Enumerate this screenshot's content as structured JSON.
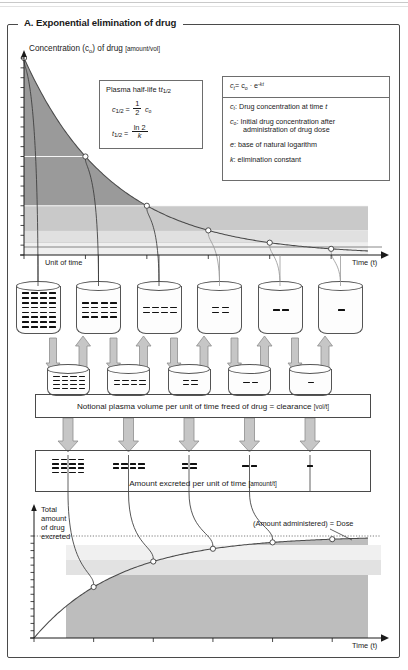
{
  "panel": {
    "title": "A. Exponential elimination of drug"
  },
  "top_chart": {
    "y_axis_label_main": "Concentration (c",
    "y_axis_label_sub": "o",
    "y_axis_label_tail": ") of drug ",
    "y_axis_units": "[amount/vol]",
    "x_axis_label": "Time (t)",
    "unit_of_time_label": "Unit of time"
  },
  "halflife_box": {
    "heading_text": "Plasma half-life t",
    "heading_sub": "1/2",
    "line1_lhs": "c",
    "line1_lhs_sub": "1/2",
    "line1_eq": "=",
    "line1_num": "1",
    "line1_den": "2",
    "line1_rhs": "c",
    "line1_rhs_sub": "o",
    "line2_lhs": "t",
    "line2_lhs_sub": "1/2",
    "line2_eq": "=",
    "line2_num": "ln 2",
    "line2_den": "k"
  },
  "formula_box": {
    "equation_lhs": "c",
    "equation_lhs_sub": "t",
    "equation_eq": "= c",
    "equation_c0_sub": "o",
    "equation_mid": " · e",
    "equation_exp": "-kt",
    "defs": [
      {
        "sym": "c",
        "sym_sub": "t",
        "text": ": Drug concentration at time ",
        "tail_italic": "t"
      },
      {
        "sym": "c",
        "sym_sub": "o",
        "text": ": Initial drug concentration after",
        "line2": "administration of drug dose"
      },
      {
        "sym": "e",
        "sym_sub": "",
        "text": ": base of natural logarithm"
      },
      {
        "sym": "k",
        "sym_sub": "",
        "text": ": elimination constant"
      }
    ]
  },
  "clearance_banner": {
    "text_main": "Notional plasma volume per unit of time freed of drug = clearance ",
    "text_units": "[vol/t]"
  },
  "excreted_banner": {
    "text_main": "Amount excreted per unit of time ",
    "text_units": "[amount/t]"
  },
  "bottom_chart": {
    "y_axis_label_lines": [
      "Total",
      "amount",
      "of drug",
      "excreted"
    ],
    "x_axis_label": "Time (t)",
    "asymptote_label": "(Amount administered) = Dose"
  },
  "beakers_row1": {
    "counts": [
      32,
      16,
      8,
      4,
      2,
      1
    ],
    "grid": [
      {
        "cols": 4,
        "rows": 8
      },
      {
        "cols": 4,
        "rows": 4
      },
      {
        "cols": 4,
        "rows": 2
      },
      {
        "cols": 2,
        "rows": 2
      },
      {
        "cols": 2,
        "rows": 1
      },
      {
        "cols": 1,
        "rows": 1
      }
    ]
  },
  "beakers_row2": {
    "counts": [
      16,
      8,
      4,
      2,
      1
    ],
    "grid": [
      {
        "cols": 4,
        "rows": 4
      },
      {
        "cols": 4,
        "rows": 2
      },
      {
        "cols": 2,
        "rows": 2
      },
      {
        "cols": 2,
        "rows": 1
      },
      {
        "cols": 1,
        "rows": 1
      }
    ]
  },
  "excreted_groups": {
    "counts": [
      16,
      8,
      4,
      2,
      1
    ],
    "grid": [
      {
        "cols": 4,
        "rows": 4
      },
      {
        "cols": 4,
        "rows": 2
      },
      {
        "cols": 2,
        "rows": 2
      },
      {
        "cols": 2,
        "rows": 1
      },
      {
        "cols": 1,
        "rows": 1
      }
    ]
  },
  "colors": {
    "ink": "#1a1a1a",
    "frame": "#4a4a4a",
    "curve": "#4d4d4d",
    "fill_dark": "#9a9a9a",
    "fill_mid": "#c4c4c4",
    "fill_light": "#dedede",
    "arrow_fill": "#c6c6c6",
    "arrow_stroke": "#8e8e8e"
  },
  "chart_data": {
    "type": "line",
    "title": "A. Exponential elimination of drug",
    "charts": [
      {
        "name": "plasma-concentration-decay",
        "type": "line",
        "title": "Exponential elimination of drug",
        "xlabel": "Time (t)",
        "ylabel": "Concentration (c_o) of drug [amount/vol]",
        "equation": "c_t = c_o · e^(-kt)",
        "x": [
          0,
          1,
          2,
          3,
          4,
          5
        ],
        "y": [
          1.0,
          0.5,
          0.25,
          0.125,
          0.0625,
          0.03125
        ],
        "x_tick_unit": "half-life (unit of time)",
        "marker_points": [
          {
            "t": 0,
            "c": 1.0
          },
          {
            "t": 1,
            "c": 0.5
          },
          {
            "t": 2,
            "c": 0.25
          },
          {
            "t": 3,
            "c": 0.125
          },
          {
            "t": 4,
            "c": 0.0625
          },
          {
            "t": 5,
            "c": 0.03125
          }
        ],
        "xlim": [
          0,
          5.6
        ],
        "ylim": [
          0,
          1.05
        ],
        "grid": false,
        "legend": "none",
        "shaded_bands": [
          {
            "from": 0.5,
            "to": 1.0,
            "shade": "dark"
          },
          {
            "from": 0.25,
            "to": 0.5,
            "shade": "mid"
          },
          {
            "from": 0.125,
            "to": 0.25,
            "shade": "light"
          }
        ]
      },
      {
        "name": "cumulative-excretion",
        "type": "area",
        "title": "Total amount of drug excreted",
        "xlabel": "Time (t)",
        "ylabel": "Total amount of drug excreted",
        "x": [
          0,
          1,
          2,
          3,
          4,
          5
        ],
        "y": [
          0,
          0.5,
          0.75,
          0.875,
          0.9375,
          0.96875
        ],
        "asymptote": {
          "value": 1.0,
          "label": "(Amount administered) = Dose"
        },
        "marker_points": [
          {
            "t": 1,
            "cum": 0.5
          },
          {
            "t": 2,
            "cum": 0.75
          },
          {
            "t": 3,
            "cum": 0.875
          },
          {
            "t": 4,
            "cum": 0.9375
          }
        ],
        "xlim": [
          0,
          5.6
        ],
        "ylim": [
          0,
          1.05
        ],
        "grid": false,
        "legend": "none"
      }
    ]
  }
}
